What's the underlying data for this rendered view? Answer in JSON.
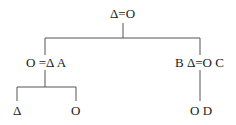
{
  "tree": {
    "root": {
      "label": "Δ=O"
    },
    "left": {
      "label": "O =Δ A",
      "children": [
        {
          "label": "Δ"
        },
        {
          "label": "O"
        }
      ]
    },
    "right": {
      "label": "B Δ=O C",
      "children": [
        {
          "label": "O D"
        }
      ]
    }
  },
  "colors": {
    "line": "#444444",
    "text": "#1a1a1a",
    "background": "#ffffff"
  }
}
